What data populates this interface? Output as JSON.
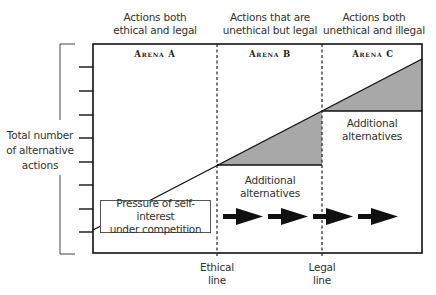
{
  "columns": [
    {
      "header": "Actions both\nethical and legal",
      "header_line1": "Actions both",
      "header_line2": "ethical and legal",
      "arena": "Arena A"
    },
    {
      "header_line1": "Actions that are",
      "header_line2": "unethical but legal",
      "arena": "Arena B"
    },
    {
      "header_line1": "Actions both",
      "header_line2": "unethical and illegal",
      "arena": "Arena C"
    }
  ],
  "y_axis": {
    "label_line1": "Total number",
    "label_line2": "of alternative",
    "label_line3": "actions",
    "tick_count": 8
  },
  "regions": {
    "b_label_line1": "Additional",
    "b_label_line2": "alternatives",
    "c_label_line1": "Additional",
    "c_label_line2": "alternatives"
  },
  "pressure_box": {
    "line1": "Pressure of self-interest",
    "line2": "under competition"
  },
  "x_markers": {
    "ethical_line1": "Ethical",
    "ethical_line2": "line",
    "legal_line1": "Legal",
    "legal_line2": "line"
  },
  "arrows": {
    "count": 4
  },
  "colors": {
    "shade": "#a8a8a8",
    "line": "#111111"
  }
}
